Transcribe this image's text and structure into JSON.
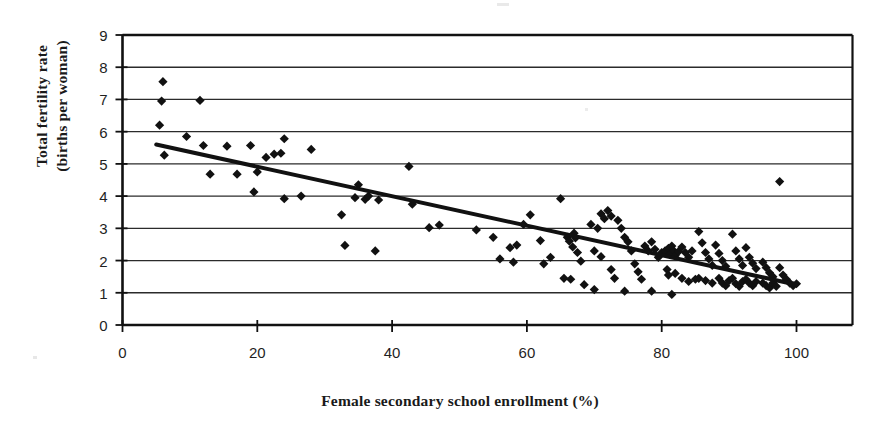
{
  "figure": {
    "type": "scatter-plot",
    "background": "#ffffff",
    "ink_color": "#111111",
    "grid_color": "#2b2b2b",
    "axis_title_x": "Female secondary school enrollment (%)",
    "axis_title_y_line1": "Total fertility rate",
    "axis_title_y_line2": "(births per woman)"
  },
  "chart_data": {
    "type": "scatter",
    "title": "",
    "xlabel": "Female secondary school enrollment (%)",
    "ylabel": "Total fertility rate (births per woman)",
    "xlim": [
      0,
      108
    ],
    "ylim": [
      0,
      9
    ],
    "xticks": [
      0,
      20,
      40,
      60,
      80,
      100
    ],
    "xtick_labels": [
      "0",
      "20",
      "40",
      "60",
      "80",
      "100"
    ],
    "yticks": [
      0,
      1,
      2,
      3,
      4,
      5,
      6,
      7,
      8,
      9
    ],
    "ytick_labels": [
      "0",
      "1",
      "2",
      "3",
      "4",
      "5",
      "6",
      "7",
      "8",
      "9"
    ],
    "grid": "horizontal",
    "legend": "none",
    "marker": "diamond",
    "marker_color": "#111111",
    "marker_size": 8,
    "trendline": {
      "label": "linear fit",
      "color": "#111111",
      "width": 4,
      "x_start": 5.0,
      "y_start": 5.6,
      "x_end": 100.0,
      "y_end": 1.25,
      "slope": -0.0458,
      "intercept": 5.829
    },
    "points": [
      [
        6.0,
        7.55
      ],
      [
        5.8,
        6.95
      ],
      [
        11.5,
        6.97
      ],
      [
        5.5,
        6.2
      ],
      [
        9.5,
        5.85
      ],
      [
        12.0,
        5.57
      ],
      [
        6.2,
        5.27
      ],
      [
        15.5,
        5.55
      ],
      [
        19.0,
        5.57
      ],
      [
        24.0,
        5.78
      ],
      [
        28.0,
        5.45
      ],
      [
        21.3,
        5.2
      ],
      [
        22.5,
        5.3
      ],
      [
        23.5,
        5.33
      ],
      [
        17.0,
        4.68
      ],
      [
        20.0,
        4.75
      ],
      [
        19.5,
        4.13
      ],
      [
        24.0,
        3.92
      ],
      [
        26.5,
        4.0
      ],
      [
        13.0,
        4.68
      ],
      [
        32.5,
        3.42
      ],
      [
        34.5,
        3.95
      ],
      [
        35.0,
        4.35
      ],
      [
        36.0,
        3.9
      ],
      [
        36.5,
        4.0
      ],
      [
        38.0,
        3.88
      ],
      [
        33.0,
        2.47
      ],
      [
        37.5,
        2.3
      ],
      [
        42.5,
        4.92
      ],
      [
        43.0,
        3.75
      ],
      [
        45.5,
        3.02
      ],
      [
        47.0,
        3.1
      ],
      [
        52.5,
        2.95
      ],
      [
        55.0,
        2.72
      ],
      [
        57.5,
        2.4
      ],
      [
        58.5,
        2.48
      ],
      [
        59.5,
        3.12
      ],
      [
        60.5,
        3.42
      ],
      [
        62.0,
        2.62
      ],
      [
        63.5,
        2.1
      ],
      [
        65.0,
        3.92
      ],
      [
        66.0,
        2.72
      ],
      [
        66.3,
        2.6
      ],
      [
        66.8,
        2.42
      ],
      [
        67.0,
        2.85
      ],
      [
        67.2,
        2.7
      ],
      [
        67.5,
        2.25
      ],
      [
        68.0,
        1.98
      ],
      [
        65.5,
        1.45
      ],
      [
        66.5,
        1.42
      ],
      [
        69.5,
        3.12
      ],
      [
        70.5,
        3.0
      ],
      [
        71.0,
        3.45
      ],
      [
        71.5,
        3.3
      ],
      [
        72.0,
        3.55
      ],
      [
        72.5,
        3.38
      ],
      [
        70.0,
        2.3
      ],
      [
        71.0,
        2.12
      ],
      [
        72.5,
        1.72
      ],
      [
        73.0,
        1.45
      ],
      [
        73.5,
        3.25
      ],
      [
        74.0,
        3.0
      ],
      [
        74.5,
        2.72
      ],
      [
        75.0,
        2.58
      ],
      [
        75.5,
        2.3
      ],
      [
        76.0,
        1.9
      ],
      [
        76.5,
        1.65
      ],
      [
        77.0,
        1.42
      ],
      [
        77.5,
        2.45
      ],
      [
        78.0,
        2.3
      ],
      [
        78.5,
        2.58
      ],
      [
        79.0,
        2.35
      ],
      [
        79.5,
        2.1
      ],
      [
        80.0,
        2.25
      ],
      [
        80.5,
        2.3
      ],
      [
        81.0,
        2.38
      ],
      [
        81.2,
        2.2
      ],
      [
        81.5,
        2.45
      ],
      [
        81.8,
        2.3
      ],
      [
        82.0,
        2.15
      ],
      [
        80.8,
        1.72
      ],
      [
        81.0,
        1.55
      ],
      [
        81.5,
        0.95
      ],
      [
        82.5,
        2.28
      ],
      [
        83.0,
        2.42
      ],
      [
        83.5,
        2.25
      ],
      [
        84.0,
        2.1
      ],
      [
        84.5,
        2.3
      ],
      [
        82.0,
        1.6
      ],
      [
        83.0,
        1.45
      ],
      [
        84.0,
        1.35
      ],
      [
        85.0,
        1.42
      ],
      [
        85.5,
        2.9
      ],
      [
        86.0,
        2.55
      ],
      [
        86.5,
        2.25
      ],
      [
        87.0,
        2.05
      ],
      [
        87.5,
        1.85
      ],
      [
        85.5,
        1.45
      ],
      [
        86.5,
        1.38
      ],
      [
        87.5,
        1.3
      ],
      [
        88.0,
        2.48
      ],
      [
        88.5,
        2.22
      ],
      [
        89.0,
        2.0
      ],
      [
        89.5,
        1.82
      ],
      [
        88.5,
        1.45
      ],
      [
        89.0,
        1.3
      ],
      [
        89.5,
        1.22
      ],
      [
        90.0,
        1.38
      ],
      [
        90.5,
        2.82
      ],
      [
        91.0,
        2.3
      ],
      [
        91.5,
        2.05
      ],
      [
        92.0,
        1.85
      ],
      [
        90.5,
        1.45
      ],
      [
        91.0,
        1.28
      ],
      [
        91.5,
        1.2
      ],
      [
        92.0,
        1.35
      ],
      [
        92.5,
        2.4
      ],
      [
        93.0,
        2.1
      ],
      [
        93.5,
        1.92
      ],
      [
        94.0,
        1.75
      ],
      [
        92.5,
        1.42
      ],
      [
        93.0,
        1.3
      ],
      [
        93.5,
        1.22
      ],
      [
        94.0,
        1.35
      ],
      [
        95.0,
        1.95
      ],
      [
        95.5,
        1.78
      ],
      [
        96.0,
        1.62
      ],
      [
        96.5,
        1.5
      ],
      [
        95.0,
        1.3
      ],
      [
        95.5,
        1.22
      ],
      [
        96.0,
        1.15
      ],
      [
        96.5,
        1.3
      ],
      [
        97.5,
        1.78
      ],
      [
        98.0,
        1.55
      ],
      [
        98.5,
        1.42
      ],
      [
        99.0,
        1.3
      ],
      [
        97.0,
        1.2
      ],
      [
        99.5,
        1.22
      ],
      [
        100.0,
        1.28
      ],
      [
        97.5,
        4.45
      ],
      [
        58.0,
        1.95
      ],
      [
        62.5,
        1.9
      ],
      [
        56.0,
        2.05
      ],
      [
        68.5,
        1.25
      ],
      [
        70.0,
        1.1
      ],
      [
        74.5,
        1.05
      ],
      [
        78.5,
        1.05
      ]
    ]
  }
}
